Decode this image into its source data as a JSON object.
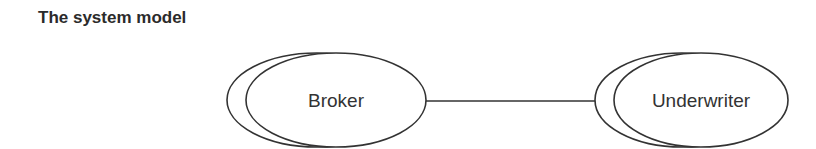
{
  "title": "The system model",
  "diagram": {
    "nodes": [
      {
        "id": "broker",
        "label": "Broker"
      },
      {
        "id": "underwriter",
        "label": "Underwriter"
      }
    ],
    "edges": [
      {
        "from": "broker",
        "to": "underwriter"
      }
    ],
    "stroke_color": "#333333",
    "text_color": "#333333"
  }
}
